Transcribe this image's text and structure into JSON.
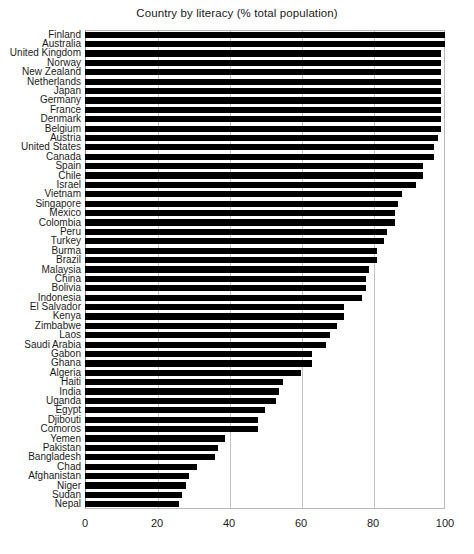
{
  "chart_data": {
    "type": "bar",
    "orientation": "horizontal",
    "title": "Country by literacy (% total population)",
    "xlabel": "",
    "ylabel": "",
    "xlim": [
      0,
      100
    ],
    "xticks": [
      0,
      20,
      40,
      60,
      80,
      100
    ],
    "grid": true,
    "legend": false,
    "bar_color": "#000000",
    "categories": [
      "Finland",
      "Australia",
      "United Kingdom",
      "Norway",
      "New Zealand",
      "Netherlands",
      "Japan",
      "Germany",
      "France",
      "Denmark",
      "Belgium",
      "Austria",
      "United States",
      "Canada",
      "Spain",
      "Chile",
      "Israel",
      "Vietnam",
      "Singapore",
      "Mexico",
      "Colombia",
      "Peru",
      "Turkey",
      "Burma",
      "Brazil",
      "Malaysia",
      "China",
      "Bolivia",
      "Indonesia",
      "El Salvador",
      "Kenya",
      "Zimbabwe",
      "Laos",
      "Saudi Arabia",
      "Gabon",
      "Ghana",
      "Algeria",
      "Haiti",
      "India",
      "Uganda",
      "Egypt",
      "Djibouti",
      "Comoros",
      "Yemen",
      "Pakistan",
      "Bangladesh",
      "Chad",
      "Afghanistan",
      "Niger",
      "Sudan",
      "Nepal"
    ],
    "values": [
      100,
      100,
      99,
      99,
      99,
      99,
      99,
      99,
      99,
      99,
      99,
      98,
      97,
      97,
      94,
      94,
      92,
      88,
      87,
      86,
      86,
      84,
      83,
      81,
      81,
      79,
      78,
      78,
      77,
      72,
      72,
      70,
      68,
      67,
      63,
      63,
      60,
      55,
      54,
      53,
      50,
      48,
      48,
      39,
      37,
      36,
      31,
      29,
      28,
      27,
      26
    ],
    "units": "% total population",
    "value_suffix": "%"
  },
  "axis": {
    "x_tick_labels": [
      "0",
      "20",
      "40",
      "60",
      "80",
      "100"
    ]
  }
}
